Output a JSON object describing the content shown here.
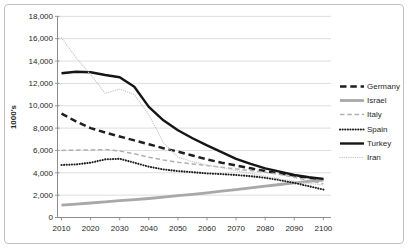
{
  "figure": {
    "ylabel": "1000's"
  },
  "chart_data": {
    "type": "line",
    "title": "",
    "xlabel": "",
    "ylabel": "1000's",
    "ylim": [
      0,
      18000
    ],
    "ytick_step": 2000,
    "xticks": [
      2010,
      2020,
      2030,
      2040,
      2050,
      2060,
      2070,
      2080,
      2090,
      2100
    ],
    "x": [
      2010,
      2015,
      2020,
      2025,
      2030,
      2035,
      2040,
      2045,
      2050,
      2055,
      2060,
      2065,
      2070,
      2075,
      2080,
      2085,
      2090,
      2095,
      2100
    ],
    "grid": "horizontal-only",
    "legend_position": "right",
    "series": [
      {
        "name": "Germany",
        "color": "#1f1f1f",
        "line_style": "long-dash",
        "width": 2.5,
        "dash": "6.5,3.8",
        "values": [
          9300,
          8600,
          8000,
          7600,
          7250,
          6900,
          6550,
          6200,
          5900,
          5550,
          5200,
          4900,
          4650,
          4400,
          4150,
          3950,
          3750,
          3550,
          3400
        ]
      },
      {
        "name": "Israel",
        "color": "#a8a8a8",
        "line_style": "solid",
        "width": 2.8,
        "dash": "",
        "values": [
          1100,
          1200,
          1300,
          1400,
          1500,
          1600,
          1700,
          1820,
          1950,
          2080,
          2200,
          2350,
          2500,
          2650,
          2800,
          2950,
          3100,
          3230,
          3350
        ]
      },
      {
        "name": "Italy",
        "color": "#b0b0b0",
        "line_style": "dash",
        "width": 1.5,
        "dash": "4.5,2.8",
        "values": [
          6000,
          6020,
          6050,
          6080,
          5950,
          5700,
          5400,
          5150,
          4950,
          4800,
          4650,
          4500,
          4350,
          4200,
          4050,
          3850,
          3600,
          3300,
          3000
        ]
      },
      {
        "name": "Spain",
        "color": "#1f1f1f",
        "line_style": "dot",
        "width": 2.1,
        "dash": "0.1,2.5",
        "values": [
          4700,
          4750,
          4900,
          5200,
          5250,
          4900,
          4550,
          4300,
          4150,
          4050,
          3950,
          3880,
          3800,
          3700,
          3550,
          3350,
          3100,
          2800,
          2500
        ]
      },
      {
        "name": "Turkey",
        "color": "#151515",
        "line_style": "solid",
        "width": 2.4,
        "dash": "",
        "values": [
          12900,
          13050,
          13000,
          12750,
          12550,
          11700,
          9900,
          8700,
          7800,
          7100,
          6450,
          5850,
          5250,
          4800,
          4400,
          4100,
          3800,
          3600,
          3450
        ]
      },
      {
        "name": "Iran",
        "color": "#c8c8c8",
        "line_style": "fine-dot",
        "width": 1.3,
        "dash": "0.1,2.1",
        "values": [
          16100,
          14300,
          12800,
          11100,
          11500,
          11000,
          9200,
          6700,
          5400,
          5000,
          4700,
          4450,
          4200,
          3950,
          3700,
          3450,
          3250,
          3050,
          2900
        ]
      }
    ],
    "colors": {
      "gridline": "#d9d9d9",
      "axis": "#8c8c8c",
      "tick_label": "#262626",
      "figure_border": "#c3c3c3",
      "background": "#ffffff"
    }
  }
}
